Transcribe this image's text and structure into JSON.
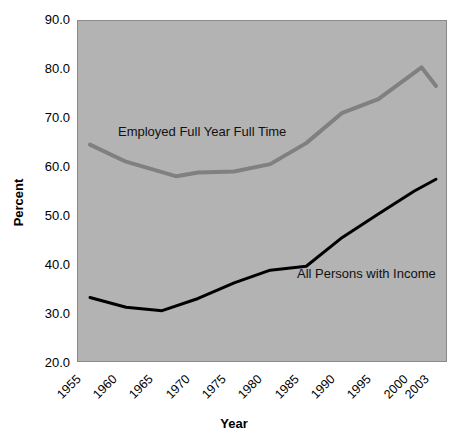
{
  "chart_data": {
    "type": "line",
    "title": "",
    "xlabel": "Year",
    "ylabel": "Percent",
    "ylim": [
      20.0,
      90.0
    ],
    "ytick_labels": [
      "90.0",
      "80.0",
      "70.0",
      "60.0",
      "50.0",
      "40.0",
      "30.0",
      "20.0"
    ],
    "ytick_values": [
      90.0,
      80.0,
      70.0,
      60.0,
      50.0,
      40.0,
      30.0,
      20.0
    ],
    "xtick_labels": [
      "1955",
      "1960",
      "1965",
      "1970",
      "1975",
      "1980",
      "1985",
      "1990",
      "1995",
      "2000",
      "2003"
    ],
    "xtick_values": [
      1955,
      1960,
      1965,
      1970,
      1975,
      1980,
      1985,
      1990,
      1995,
      2000,
      2003
    ],
    "xlim": [
      1955,
      2003
    ],
    "grid": false,
    "legend": "inline-annotations",
    "plot_background_color": "#b3b3b3",
    "series": [
      {
        "name": "Employed Full Year Full Time",
        "color": "#808080",
        "line_width": 4,
        "x": [
          1955,
          1960,
          1967,
          1970,
          1975,
          1980,
          1985,
          1990,
          1995,
          2001,
          2003
        ],
        "values": [
          64.5,
          61.0,
          58.0,
          58.8,
          59.0,
          60.5,
          64.8,
          71.0,
          73.8,
          80.3,
          76.5
        ]
      },
      {
        "name": "All Persons with Income",
        "color": "#000000",
        "line_width": 3,
        "x": [
          1955,
          1960,
          1965,
          1970,
          1975,
          1980,
          1985,
          1990,
          1995,
          2000,
          2003
        ],
        "values": [
          33.2,
          31.2,
          30.5,
          33.0,
          36.2,
          38.8,
          39.6,
          45.5,
          50.3,
          55.0,
          57.4
        ]
      }
    ],
    "annotations": [
      {
        "text": "Employed Full Year Full Time",
        "x": 1965,
        "y": 69.5
      },
      {
        "text": "All Persons with Income",
        "x": 1990,
        "y": 40.5
      }
    ]
  }
}
